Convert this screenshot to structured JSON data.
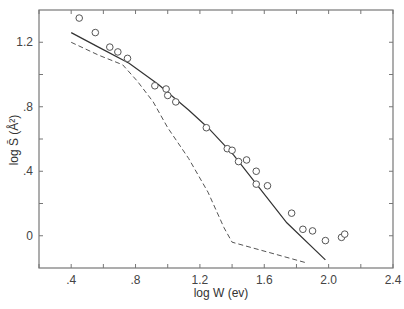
{
  "chart_data": {
    "type": "scatter",
    "title": "",
    "xlabel": "log W (ev)",
    "ylabel": "log S̄ (Å²)",
    "xlim": [
      0.2,
      2.4
    ],
    "ylim": [
      -0.2,
      1.4
    ],
    "grid": false,
    "legend": null,
    "x_ticks": [
      0.4,
      0.8,
      1.2,
      1.6,
      2.0,
      2.4
    ],
    "x_tick_labels": [
      ".4",
      ".8",
      "1.2",
      "1.6",
      "2.0",
      "2.4"
    ],
    "x_minor_ticks": [
      0.2,
      0.6,
      1.0,
      1.4,
      1.8,
      2.2
    ],
    "y_ticks": [
      0,
      0.4,
      0.8,
      1.2
    ],
    "y_tick_labels": [
      "0",
      ".4",
      ".8",
      "1.2"
    ],
    "y_minor_ticks": [
      0.2,
      0.6,
      1.0
    ],
    "series": [
      {
        "name": "experimental",
        "style": "open-circle-markers",
        "x": [
          0.45,
          0.55,
          0.64,
          0.69,
          0.75,
          0.92,
          0.99,
          1.0,
          1.05,
          1.24,
          1.37,
          1.4,
          1.44,
          1.49,
          1.55,
          1.55,
          1.62,
          1.77,
          1.84,
          1.9,
          1.98,
          2.08,
          2.1
        ],
        "y": [
          1.35,
          1.26,
          1.17,
          1.14,
          1.1,
          0.93,
          0.91,
          0.87,
          0.83,
          0.67,
          0.54,
          0.53,
          0.46,
          0.47,
          0.4,
          0.32,
          0.31,
          0.14,
          0.04,
          0.03,
          -0.03,
          -0.01,
          0.01
        ]
      },
      {
        "name": "theory-solid",
        "style": "solid-line",
        "x": [
          0.4,
          0.57,
          0.76,
          0.94,
          1.13,
          1.25,
          1.41,
          1.56,
          1.74,
          1.98
        ],
        "y": [
          1.26,
          1.17,
          1.07,
          0.94,
          0.78,
          0.67,
          0.5,
          0.31,
          0.08,
          -0.15
        ]
      },
      {
        "name": "theory-dashed",
        "style": "dashed-line",
        "x": [
          0.4,
          0.57,
          0.72,
          0.81,
          0.91,
          1.0,
          1.13,
          1.25,
          1.35,
          1.4,
          1.87
        ],
        "y": [
          1.2,
          1.12,
          1.06,
          0.96,
          0.83,
          0.67,
          0.48,
          0.27,
          0.05,
          -0.04,
          -0.17
        ]
      }
    ]
  },
  "axes": {
    "xlabel": "log W (ev)",
    "ylabel": "log S̄ (Å²)"
  }
}
